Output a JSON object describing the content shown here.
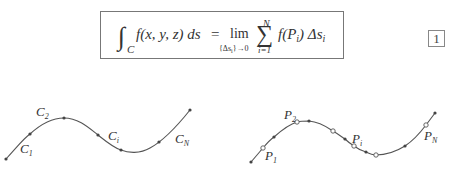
{
  "formula": {
    "lhs_integral_sub": "C",
    "lhs_integrand": "f(x, y, z) ds",
    "equals": "=",
    "lim": "lim",
    "lim_sub": "{Δs",
    "lim_sub_i": "i",
    "lim_sub_end": "}→0",
    "sum_upper": "N",
    "sum_lower": "i=1",
    "summand_f": "f(P",
    "summand_i": "i",
    "summand_close": ") Δs",
    "summand_si": "i"
  },
  "equation_number": "1",
  "figure_left": {
    "labels": [
      {
        "main": "C",
        "sub": "1"
      },
      {
        "main": "C",
        "sub": "2"
      },
      {
        "main": "C",
        "sub": "i"
      },
      {
        "main": "C",
        "sub": "N"
      }
    ]
  },
  "figure_right": {
    "labels": [
      {
        "main": "P",
        "sub": "1"
      },
      {
        "main": "P",
        "sub": "2"
      },
      {
        "main": "P",
        "sub": "i"
      },
      {
        "main": "P",
        "sub": "N"
      }
    ]
  }
}
